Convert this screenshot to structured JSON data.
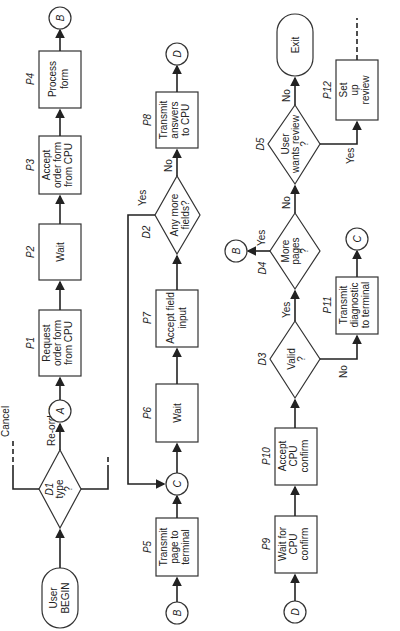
{
  "diagram": {
    "type": "flowchart",
    "orientation": "rotated-90-ccw",
    "terminators": {
      "begin": {
        "line1": "User",
        "line2": "BEGIN"
      },
      "exit": {
        "label": "Exit"
      }
    },
    "connectors": {
      "A": "A",
      "B": "B",
      "C": "C",
      "D": "D"
    },
    "processes": {
      "P1": {
        "id": "P1",
        "lines": [
          "Request",
          "order form",
          "from CPU"
        ]
      },
      "P2": {
        "id": "P2",
        "lines": [
          "Wait"
        ]
      },
      "P3": {
        "id": "P3",
        "lines": [
          "Accept",
          "order form",
          "from CPU"
        ]
      },
      "P4": {
        "id": "P4",
        "lines": [
          "Process",
          "form"
        ]
      },
      "P5": {
        "id": "P5",
        "lines": [
          "Transmit",
          "page to",
          "terminal"
        ]
      },
      "P6": {
        "id": "P6",
        "lines": [
          "Wait"
        ]
      },
      "P7": {
        "id": "P7",
        "lines": [
          "Accept field",
          "input"
        ]
      },
      "P8": {
        "id": "P8",
        "lines": [
          "Transmit",
          "answers",
          "to CPU"
        ]
      },
      "P9": {
        "id": "P9",
        "lines": [
          "Wait for",
          "CPU",
          "confirm"
        ]
      },
      "P10": {
        "id": "P10",
        "lines": [
          "Accept",
          "CPU",
          "confirm"
        ]
      },
      "P11": {
        "id": "P11",
        "lines": [
          "Transmit",
          "diagnostic",
          "to terminal"
        ]
      },
      "P12": {
        "id": "P12",
        "lines": [
          "Set",
          "up",
          "review"
        ]
      }
    },
    "decisions": {
      "D1": {
        "id": "D1",
        "lines": [
          "type",
          "?"
        ]
      },
      "D2": {
        "id": "D2",
        "lines": [
          "Any more",
          "fields?"
        ]
      },
      "D3": {
        "id": "D3",
        "lines": [
          "Valid",
          "?"
        ]
      },
      "D4": {
        "id": "D4",
        "lines": [
          "More",
          "pages",
          "?"
        ]
      },
      "D5": {
        "id": "D5",
        "lines": [
          "User",
          "wants review",
          "?"
        ]
      }
    },
    "edge_labels": {
      "cancel": "Cancel",
      "reorder": "Re-order",
      "yes": "Yes",
      "no": "No"
    }
  }
}
